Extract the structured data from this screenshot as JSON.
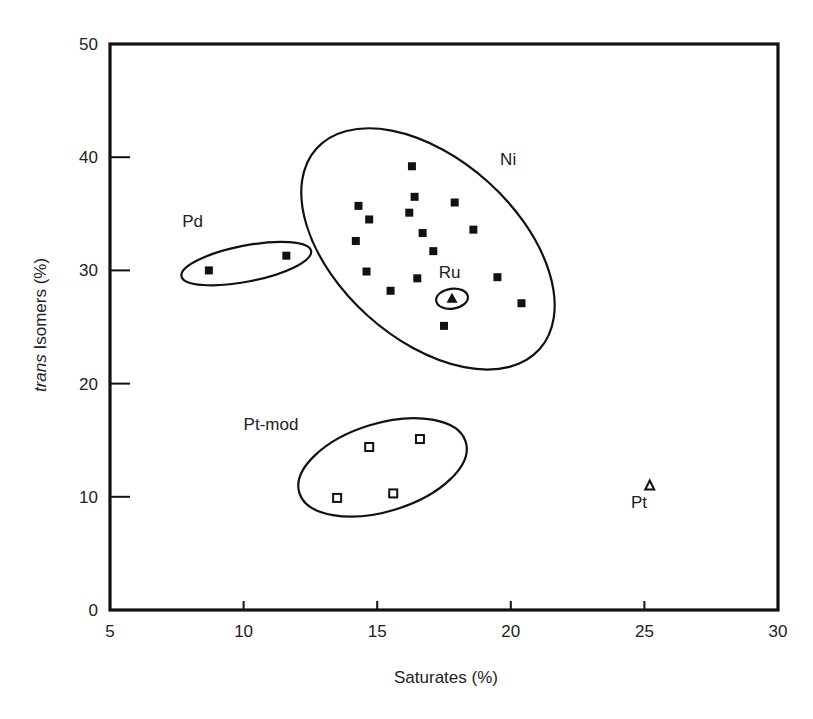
{
  "chart_data": {
    "type": "scatter",
    "title": "",
    "xlabel": "Saturates (%)",
    "ylabel_italic": "trans",
    "ylabel_rest": " Isomers (%)",
    "ylabel": "trans Isomers (%)",
    "xlim": [
      5,
      30
    ],
    "ylim": [
      0,
      50
    ],
    "xticks": [
      5,
      10,
      15,
      20,
      25,
      30
    ],
    "yticks": [
      0,
      10,
      20,
      30,
      40,
      50
    ],
    "grid": false,
    "legend": null,
    "series": [
      {
        "name": "Ni",
        "marker": "filled-square",
        "points": [
          [
            16.3,
            39.2
          ],
          [
            16.4,
            36.5
          ],
          [
            17.9,
            36.0
          ],
          [
            14.3,
            35.7
          ],
          [
            14.7,
            34.5
          ],
          [
            16.2,
            35.1
          ],
          [
            18.6,
            33.6
          ],
          [
            16.7,
            33.3
          ],
          [
            14.2,
            32.6
          ],
          [
            17.1,
            31.7
          ],
          [
            14.6,
            29.9
          ],
          [
            16.5,
            29.3
          ],
          [
            19.5,
            29.4
          ],
          [
            15.5,
            28.2
          ],
          [
            20.4,
            27.1
          ],
          [
            17.5,
            25.1
          ]
        ]
      },
      {
        "name": "Ru",
        "marker": "filled-triangle",
        "points": [
          [
            17.8,
            27.5
          ]
        ]
      },
      {
        "name": "Pd",
        "marker": "filled-square",
        "points": [
          [
            8.7,
            30.0
          ],
          [
            11.6,
            31.3
          ]
        ]
      },
      {
        "name": "Pt-mod",
        "marker": "open-square",
        "points": [
          [
            14.7,
            14.4
          ],
          [
            16.6,
            15.1
          ],
          [
            13.5,
            9.9
          ],
          [
            15.6,
            10.3
          ]
        ]
      },
      {
        "name": "Pt",
        "marker": "open-triangle",
        "points": [
          [
            25.2,
            11.0
          ]
        ]
      }
    ],
    "annotations": [
      {
        "text": "Ni",
        "x": 19.6,
        "y": 39.3
      },
      {
        "text": "Ru",
        "x": 17.3,
        "y": 29.3
      },
      {
        "text": "Pd",
        "x": 7.7,
        "y": 33.8
      },
      {
        "text": "Pt-mod",
        "x": 10.0,
        "y": 15.9
      },
      {
        "text": "Pt",
        "x": 24.5,
        "y": 9.0
      }
    ],
    "enclosures": [
      {
        "group": "Ni",
        "cx": 16.9,
        "cy": 31.9,
        "rx": 150,
        "ry": 90,
        "angle": 42
      },
      {
        "group": "Ru",
        "cx": 17.8,
        "cy": 27.5,
        "rx": 16,
        "ry": 10,
        "angle": -8
      },
      {
        "group": "Pd",
        "cx": 10.1,
        "cy": 30.6,
        "rx": 66,
        "ry": 18,
        "angle": -11
      },
      {
        "group": "Pt-mod",
        "cx": 15.2,
        "cy": 12.6,
        "rx": 87,
        "ry": 44,
        "angle": -17
      }
    ]
  }
}
